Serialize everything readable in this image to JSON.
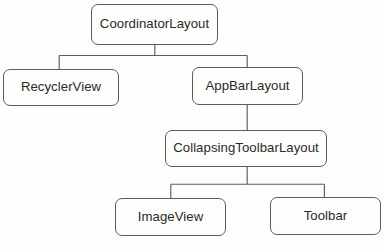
{
  "diagram": {
    "type": "tree",
    "orientation": "top-down",
    "style": {
      "background_color": "#fdfdfc",
      "node_fill": "#fdfdfc",
      "node_stroke": "#5c5c5c",
      "text_color": "#2a2a2a",
      "connector_color": "#5c5c5c"
    },
    "nodes": [
      {
        "id": "coordinatorlayout",
        "label": "CoordinatorLayout",
        "level": 0
      },
      {
        "id": "recyclerview",
        "label": "RecyclerView",
        "level": 1
      },
      {
        "id": "appbarlayout",
        "label": "AppBarLayout",
        "level": 1
      },
      {
        "id": "collapsingtoolbarlayout",
        "label": "CollapsingToolbarLayout",
        "level": 2
      },
      {
        "id": "imageview",
        "label": "ImageView",
        "level": 3
      },
      {
        "id": "toolbar",
        "label": "Toolbar",
        "level": 3
      }
    ],
    "edges": [
      {
        "from": "coordinatorlayout",
        "to": "recyclerview"
      },
      {
        "from": "coordinatorlayout",
        "to": "appbarlayout"
      },
      {
        "from": "appbarlayout",
        "to": "collapsingtoolbarlayout"
      },
      {
        "from": "collapsingtoolbarlayout",
        "to": "imageview"
      },
      {
        "from": "collapsingtoolbarlayout",
        "to": "toolbar"
      }
    ]
  }
}
